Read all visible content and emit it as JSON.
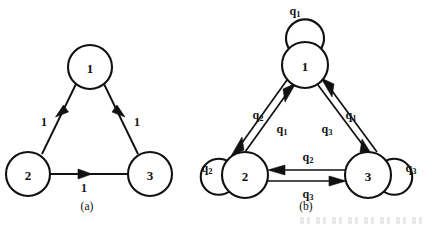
{
  "figure": {
    "type": "state-transition-diagrams",
    "background_color": "#ffffff",
    "stroke_color": "#111111",
    "panels": [
      {
        "id": "a",
        "caption": "(a)",
        "caption_x": 87,
        "caption_y": 206,
        "nodes": [
          {
            "id": "n1",
            "label": "1",
            "cx": 90,
            "cy": 67,
            "r": 22
          },
          {
            "id": "n2",
            "label": "2",
            "cx": 28,
            "cy": 174,
            "r": 22
          },
          {
            "id": "n3",
            "label": "3",
            "cx": 150,
            "cy": 174,
            "r": 22
          }
        ],
        "edges": [
          {
            "from": "n1",
            "to": "n2",
            "label": "1",
            "label_x": 44,
            "label_y": 122
          },
          {
            "from": "n1",
            "to": "n3",
            "label": "1",
            "label_x": 137,
            "label_y": 122
          },
          {
            "from": "n2",
            "to": "n3",
            "label": "1",
            "label_x": 84,
            "label_y": 188
          }
        ],
        "self_loops": []
      },
      {
        "id": "b",
        "caption": "(b)",
        "caption_x": 306,
        "caption_y": 206,
        "nodes": [
          {
            "id": "m1",
            "label": "1",
            "cx": 305,
            "cy": 65,
            "r": 23
          },
          {
            "id": "m2",
            "label": "2",
            "cx": 245,
            "cy": 175,
            "r": 23
          },
          {
            "id": "m3",
            "label": "3",
            "cx": 368,
            "cy": 175,
            "r": 23
          }
        ],
        "edges": [
          {
            "from": "m1",
            "to": "m2",
            "label": "q",
            "sub": "2",
            "label_x": 260,
            "label_y": 115
          },
          {
            "from": "m2",
            "to": "m1",
            "label": "q",
            "sub": "1",
            "label_x": 283,
            "label_y": 128
          },
          {
            "from": "m1",
            "to": "m3",
            "label": "q",
            "sub": "3",
            "label_x": 326,
            "label_y": 128
          },
          {
            "from": "m3",
            "to": "m1",
            "label": "q",
            "sub": "1",
            "label_x": 350,
            "label_y": 115
          },
          {
            "from": "m3",
            "to": "m2",
            "label": "q",
            "sub": "2",
            "label_x": 308,
            "label_y": 158
          },
          {
            "from": "m2",
            "to": "m3",
            "label": "q",
            "sub": "3",
            "label_x": 308,
            "label_y": 192
          }
        ],
        "self_loops": [
          {
            "node": "m1",
            "label": "q",
            "sub": "1",
            "position": "top",
            "label_x": 297,
            "label_y": 11
          },
          {
            "node": "m2",
            "label": "q",
            "sub": "2",
            "position": "left",
            "label_x": 208,
            "label_y": 168
          },
          {
            "node": "m3",
            "label": "q",
            "sub": "3",
            "position": "right",
            "label_x": 412,
            "label_y": 168
          }
        ]
      }
    ]
  }
}
